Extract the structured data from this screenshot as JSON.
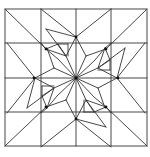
{
  "figure": {
    "type": "quilt-block-line-drawing",
    "colors": {
      "stroke": "#333333",
      "background": "#ffffff",
      "dot": "#111111"
    },
    "frame": {
      "x": 5,
      "y": 9,
      "width": 142,
      "height": 137
    },
    "grid": {
      "cols": [
        5,
        41,
        76,
        111,
        147
      ],
      "rows": [
        9,
        43,
        78,
        112,
        146
      ]
    },
    "center": {
      "x": 76,
      "y": 78
    },
    "dots": [
      {
        "x": 76,
        "y": 78
      },
      {
        "x": 76,
        "y": 37
      },
      {
        "x": 118,
        "y": 78
      },
      {
        "x": 76,
        "y": 119
      },
      {
        "x": 34,
        "y": 78
      },
      {
        "x": 46,
        "y": 49
      },
      {
        "x": 106,
        "y": 49
      },
      {
        "x": 106,
        "y": 107
      },
      {
        "x": 46,
        "y": 107
      }
    ]
  }
}
